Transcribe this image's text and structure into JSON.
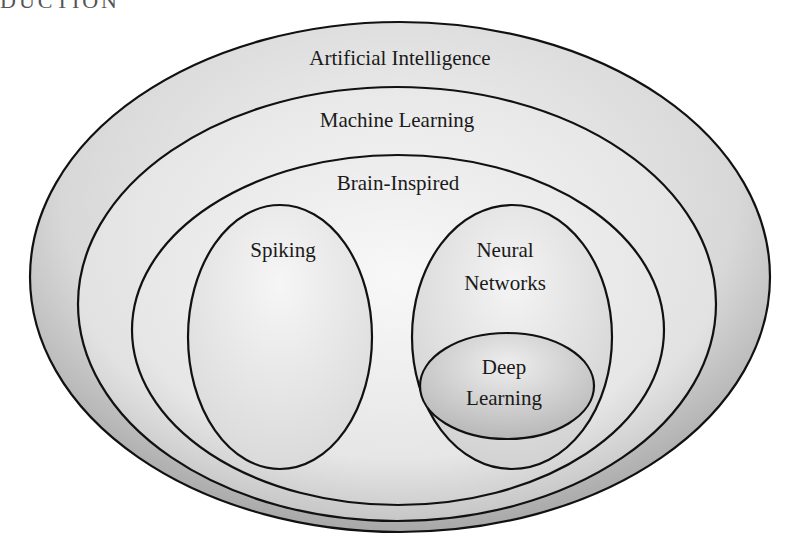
{
  "header": {
    "fragment": "DUCTION"
  },
  "diagram": {
    "type": "nested-venn",
    "sets": [
      {
        "id": "ai",
        "label": "Artificial Intelligence",
        "fill": "#c8c8c8"
      },
      {
        "id": "ml",
        "label": "Machine Learning",
        "fill": "#dcdcdc"
      },
      {
        "id": "bi",
        "label": "Brain-Inspired",
        "fill": "#e6e6e6"
      },
      {
        "id": "spiking",
        "label": "Spiking",
        "fill": "#ececec"
      },
      {
        "id": "nn",
        "label_line1": "Neural",
        "label_line2": "Networks",
        "fill": "#e4e4e4"
      },
      {
        "id": "dl",
        "label_line1": "Deep",
        "label_line2": "Learning",
        "fill": "#cfcfcf"
      }
    ],
    "stroke_color": "#111111"
  }
}
